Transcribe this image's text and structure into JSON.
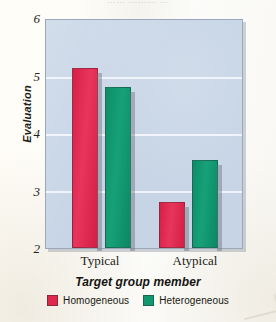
{
  "page": {
    "cutoff_header_text": "……  ………  …"
  },
  "chart_data": {
    "type": "bar",
    "title": "",
    "xlabel": "Target group member",
    "ylabel": "Evaluation",
    "categories": [
      "Typical",
      "Atypical"
    ],
    "series": [
      {
        "name": "Homogeneous",
        "color": "#e0284c",
        "values": [
          5.15,
          2.8
        ]
      },
      {
        "name": "Heterogeneous",
        "color": "#109870",
        "values": [
          4.83,
          3.55
        ]
      }
    ],
    "ylim": [
      2,
      6
    ],
    "yticks": [
      6,
      5,
      4,
      3,
      2
    ],
    "ytick_labels": [
      "6",
      "5",
      "4",
      "3",
      "2"
    ],
    "grid": true,
    "gridlines_at": [
      5,
      4,
      3
    ],
    "legend_position": "bottom-center",
    "plot_background": "#c6d4e5",
    "page_background": "#fdfdfb"
  }
}
